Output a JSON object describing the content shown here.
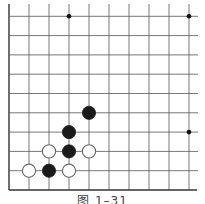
{
  "diagram": {
    "type": "go-board-fragment",
    "caption": "图 1–31",
    "grid": {
      "columns": 10,
      "rows": 10,
      "origin_x": 9,
      "origin_y": 190,
      "spacing_x": 20,
      "spacing_y": 19.3,
      "edges": [
        "left",
        "bottom"
      ],
      "line_color": "#555555",
      "edge_color": "#333333"
    },
    "star_points": [
      {
        "col": 3,
        "row": 9
      },
      {
        "col": 9,
        "row": 9
      },
      {
        "col": 9,
        "row": 3
      }
    ],
    "stones": [
      {
        "color": "black",
        "col": 4,
        "row": 4
      },
      {
        "color": "black",
        "col": 3,
        "row": 3
      },
      {
        "color": "white",
        "col": 2,
        "row": 2
      },
      {
        "color": "black",
        "col": 3,
        "row": 2
      },
      {
        "color": "white",
        "col": 4,
        "row": 2
      },
      {
        "color": "white",
        "col": 1,
        "row": 1
      },
      {
        "color": "black",
        "col": 2,
        "row": 1
      },
      {
        "color": "white",
        "col": 3,
        "row": 1
      }
    ]
  }
}
